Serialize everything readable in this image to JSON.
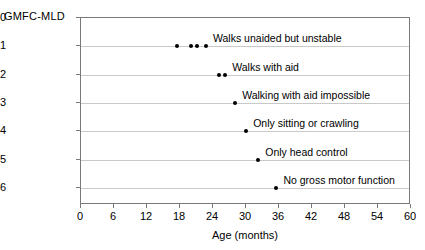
{
  "chart_data": {
    "type": "scatter",
    "title": "",
    "xlabel": "Age (months)",
    "ylabel": "GMFC-MLD",
    "xlim": [
      0,
      60
    ],
    "ylim": [
      0,
      6.6
    ],
    "y_inverted": true,
    "grid": true,
    "legend": "none",
    "xticks": [
      0,
      6,
      12,
      18,
      24,
      30,
      36,
      42,
      48,
      54,
      60
    ],
    "xtick_labels": [
      "0",
      "6",
      "12",
      "18",
      "24",
      "30",
      "36",
      "42",
      "48",
      "54",
      "60"
    ],
    "yticks": [
      0,
      1,
      2,
      3,
      4,
      5,
      6
    ],
    "ytick_labels": [
      "0",
      "1",
      "2",
      "3",
      "4",
      "5",
      "6"
    ],
    "point_color": "#000000",
    "grid_color": "#c9c9c9",
    "axis_color": "#7a7a7a",
    "points": [
      {
        "x": 17.5,
        "y": 1
      },
      {
        "x": 20.0,
        "y": 1
      },
      {
        "x": 21.0,
        "y": 1
      },
      {
        "x": 22.7,
        "y": 1
      },
      {
        "x": 25.0,
        "y": 2
      },
      {
        "x": 26.2,
        "y": 2
      },
      {
        "x": 28.0,
        "y": 3
      },
      {
        "x": 30.0,
        "y": 4
      },
      {
        "x": 32.2,
        "y": 5
      },
      {
        "x": 35.5,
        "y": 6
      }
    ],
    "annotations": [
      {
        "level": 1,
        "text": "Walks unaided but unstable",
        "x": 24.0
      },
      {
        "level": 2,
        "text": "Walks with aid",
        "x": 27.5
      },
      {
        "level": 3,
        "text": "Walking with aid impossible",
        "x": 29.3
      },
      {
        "level": 4,
        "text": "Only sitting or crawling",
        "x": 31.3
      },
      {
        "level": 5,
        "text": "Only head control",
        "x": 33.5
      },
      {
        "level": 6,
        "text": "No gross motor function",
        "x": 36.8
      }
    ]
  }
}
